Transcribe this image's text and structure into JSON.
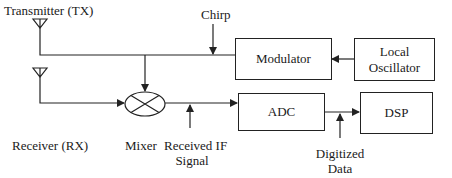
{
  "diagram": {
    "labels": {
      "transmitter": "Transmitter (TX)",
      "receiver": "Receiver (RX)",
      "chirp": "Chirp",
      "mixer": "Mixer",
      "received_if_line1": "Received IF",
      "received_if_line2": "Signal",
      "digitized_line1": "Digitized",
      "digitized_line2": "Data"
    },
    "blocks": {
      "modulator": "Modulator",
      "local_oscillator_line1": "Local",
      "local_oscillator_line2": "Oscillator",
      "adc": "ADC",
      "dsp": "DSP"
    },
    "colors": {
      "stroke": "#222222",
      "text": "#1a1a1a",
      "background": "#ffffff"
    }
  }
}
